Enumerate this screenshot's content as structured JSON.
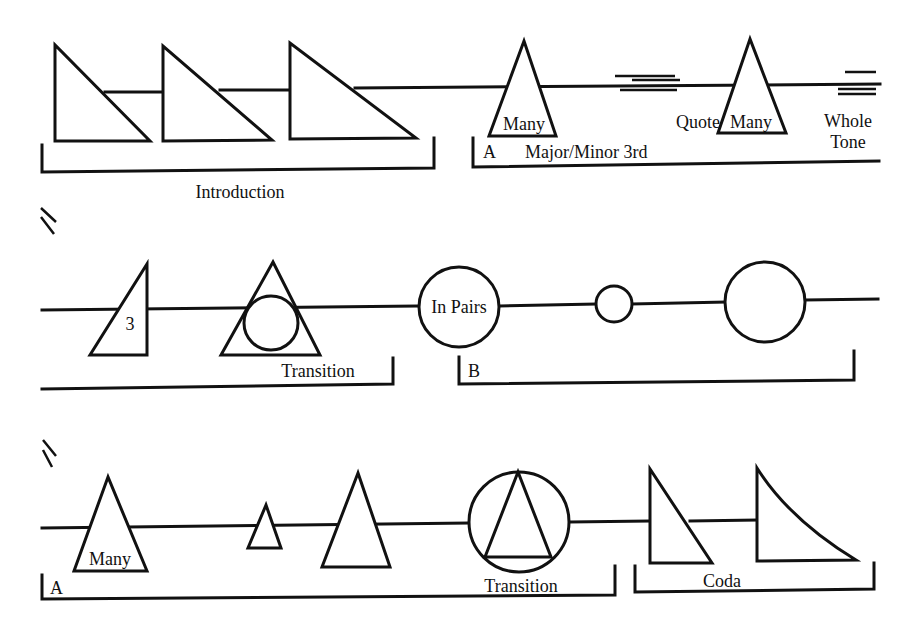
{
  "diagram": {
    "row1": {
      "introduction_label": "Introduction",
      "section_a_label": "A",
      "major_minor_label": "Major/Minor 3rd",
      "many_label_1": "Many",
      "quote_label": "Quote",
      "many_label_2": "Many",
      "whole_label": "Whole",
      "tone_label": "Tone"
    },
    "row2": {
      "continuation_mark": "//",
      "three_label": "3",
      "transition_label": "Transition",
      "in_pairs_label": "In Pairs",
      "section_b_label": "B"
    },
    "row3": {
      "continuation_mark": "//",
      "many_label": "Many",
      "section_a_label": "A",
      "transition_label": "Transition",
      "coda_label": "Coda"
    }
  }
}
